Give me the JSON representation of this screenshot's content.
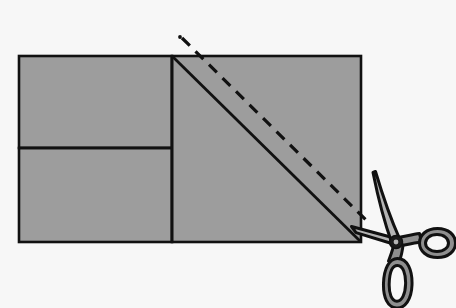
{
  "figure": {
    "title": "Paper square with scissors cutting along a dashed diagonal line",
    "caption": "",
    "canvas": {
      "width": 456,
      "height": 308
    },
    "colors": {
      "background": "#f7f7f7",
      "paper_fill": "#9d9d9d",
      "paper_stroke": "#111111",
      "fold_line": "#111111",
      "cut_line": "#111111",
      "scissors_outline": "#111111",
      "scissors_blade_fill": "#b4b4b4",
      "scissors_handle_fill": "#8f8f8f",
      "scissors_dark": "#1a1a1a"
    }
  },
  "shapes": {
    "left_top_rect": {
      "label": "left-upper-panel",
      "x": 19,
      "y": 56,
      "width": 153,
      "height": 92
    },
    "left_bottom_rect": {
      "label": "left-lower-panel",
      "x": 19,
      "y": 148,
      "width": 153,
      "height": 94
    },
    "right_square": {
      "label": "right-square-panel",
      "x": 172,
      "y": 56,
      "width": 189,
      "height": 186
    },
    "divider_vertical": {
      "label": "vertical-divider",
      "x1": 172,
      "y1": 56,
      "x2": 172,
      "y2": 242
    },
    "divider_horizontal": {
      "label": "horizontal-divider",
      "x1": 19,
      "y1": 148,
      "x2": 172,
      "y2": 148
    },
    "diagonal_solid": {
      "label": "fold-diagonal",
      "x1": 172,
      "y1": 56,
      "x2": 361,
      "y2": 242
    },
    "diagonal_dashed": {
      "label": "cut-diagonal",
      "x1": 182,
      "y1": 38,
      "x2": 367,
      "y2": 221,
      "dash": "11 8",
      "dot_x": 180,
      "dot_y": 37
    }
  },
  "scissors": {
    "label": "scissors",
    "pivot": {
      "x": 396,
      "y": 242
    },
    "blade_upper_tip": {
      "x": 375,
      "y": 172
    },
    "blade_lower_tip": {
      "x": 352,
      "y": 228
    },
    "handle_right_ring": {
      "cx": 437,
      "cy": 243,
      "rx": 18,
      "ry": 13,
      "rotation": -8
    },
    "handle_lower_ring": {
      "cx": 398,
      "cy": 285,
      "rx": 12,
      "ry": 22,
      "rotation": 6
    },
    "stroke_width": 3
  },
  "annotations": {
    "cut_line_name": "cut-line",
    "fold_line_name": "fold-line"
  }
}
